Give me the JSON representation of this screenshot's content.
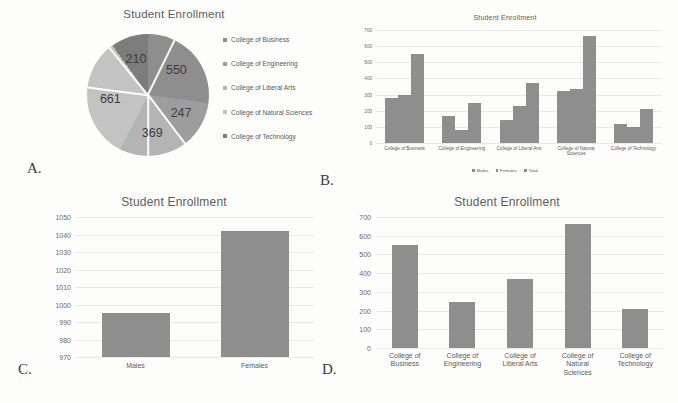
{
  "figure": {
    "panel_labels": [
      "A.",
      "B.",
      "C.",
      "D."
    ],
    "common_title": "Student Enrollment",
    "colors": {
      "bar_gray": "#8e8e8e",
      "grid_gray": "#e8e8e6",
      "text_gray": "#5a5a5a",
      "background": "#fdfdfb"
    }
  },
  "chart_data": [
    {
      "panel": "A.",
      "type": "pie",
      "title": "Student Enrollment",
      "categories": [
        "College of Business",
        "College of Engineering",
        "College of Liberal Arts",
        "College of Natural Sciences",
        "College of Technology"
      ],
      "values": [
        550,
        247,
        369,
        661,
        210
      ],
      "data_labels": [
        "550",
        "247",
        "369",
        "661",
        "210"
      ],
      "total": 2037,
      "legend": {
        "position": "right",
        "entries": [
          "College of Business",
          "College of Engineering",
          "College of Liberal Arts",
          "College of Natural Sciences",
          "College of Technology"
        ]
      },
      "slice_colors": [
        "#8e8e8e",
        "#9d9d9d",
        "#b4b4b4",
        "#c3c3c3",
        "#7c7c7c"
      ],
      "grid": false
    },
    {
      "panel": "B.",
      "type": "bar",
      "title": "Student Enrollment",
      "categories": [
        "College of Business",
        "College of Engineering",
        "College of Liberal Arts",
        "College of Natural Sciences",
        "College of Technology"
      ],
      "series": [
        {
          "name": "Males",
          "values": [
            278,
            165,
            143,
            322,
            117
          ]
        },
        {
          "name": "Females",
          "values": [
            298,
            82,
            228,
            337,
            100
          ]
        },
        {
          "name": "Total",
          "values": [
            550,
            247,
            369,
            661,
            210
          ]
        }
      ],
      "yticks": [
        0,
        100,
        200,
        300,
        400,
        500,
        600,
        700
      ],
      "ylim": [
        0,
        700
      ],
      "xlabel": "",
      "ylabel": "",
      "grid": true,
      "legend": {
        "position": "bottom",
        "entries": [
          "Males",
          "Females",
          "Total"
        ]
      }
    },
    {
      "panel": "C.",
      "type": "bar",
      "title": "Student Enrollment",
      "categories": [
        "Males",
        "Females"
      ],
      "values": [
        995,
        1042
      ],
      "yticks": [
        970,
        980,
        990,
        1000,
        1010,
        1020,
        1030,
        1040,
        1050
      ],
      "ylim": [
        970,
        1050
      ],
      "xlabel": "",
      "ylabel": "",
      "grid": true,
      "legend": {
        "position": "none",
        "entries": []
      }
    },
    {
      "panel": "D.",
      "type": "bar",
      "title": "Student Enrollment",
      "categories": [
        "College of Business",
        "College of Engineering",
        "College of Liberal Arts",
        "College of Natural Sciences",
        "College of Technology"
      ],
      "values": [
        550,
        247,
        369,
        661,
        210
      ],
      "yticks": [
        0,
        100,
        200,
        300,
        400,
        500,
        600,
        700
      ],
      "ylim": [
        0,
        700
      ],
      "xlabel": "",
      "ylabel": "",
      "grid": true,
      "legend": {
        "position": "none",
        "entries": []
      }
    }
  ]
}
